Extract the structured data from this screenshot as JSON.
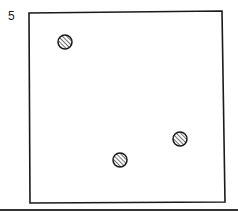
{
  "panel": {
    "label": "5",
    "frame": {
      "x1": 29,
      "y1": 12,
      "x2": 224,
      "y2": 202
    },
    "bottom_rule": {
      "y": 210,
      "x1": 0,
      "x2": 238
    },
    "points": [
      {
        "cx": 65,
        "cy": 42,
        "r": 7
      },
      {
        "cx": 120,
        "cy": 160,
        "r": 7
      },
      {
        "cx": 180,
        "cy": 139,
        "r": 7
      }
    ],
    "colors": {
      "stroke": "#1a1a1a",
      "fill": "#ffffff"
    }
  }
}
